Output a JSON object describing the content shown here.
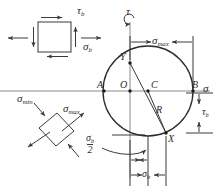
{
  "figure": {
    "stroke_color": "#3a3a3a",
    "text_color": "#2b2b2b",
    "background": "#ffffff"
  },
  "stress_element": {
    "name": "original-stress-element",
    "shear_label": "τ",
    "shear_sub": "b",
    "normal_label": "σ",
    "normal_sub": "b"
  },
  "principal_element": {
    "name": "principal-stress-element",
    "min_label": "σ",
    "min_sub": "min",
    "max_label": "σ",
    "max_sub": "max"
  },
  "mohr_circle": {
    "tau_axis_label": "τ",
    "sigma_axis_label": "σ",
    "points": [
      {
        "id": "A",
        "label": "A",
        "x": 104,
        "y": 91
      },
      {
        "id": "O",
        "label": "O",
        "x": 130,
        "y": 91
      },
      {
        "id": "C",
        "label": "C",
        "x": 148,
        "y": 91
      },
      {
        "id": "B",
        "label": "B",
        "x": 193,
        "y": 91
      },
      {
        "id": "Y",
        "label": "Y",
        "x": 130,
        "y": 63
      },
      {
        "id": "X",
        "label": "X",
        "x": 166,
        "y": 133
      }
    ],
    "radius_label": "R",
    "dimensions": [
      {
        "id": "sigma-max",
        "label": "σ",
        "sub": "max"
      },
      {
        "id": "tau-b",
        "label": "τ",
        "sub": "b"
      },
      {
        "id": "sigma-b",
        "label": "σ",
        "sub": "b"
      }
    ],
    "fraction": {
      "numerator": "σ",
      "numerator_sub": "b",
      "denominator": "2"
    }
  }
}
